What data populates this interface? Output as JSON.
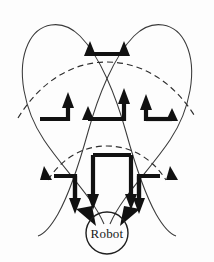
{
  "figure": {
    "robot": {
      "label": "Robot",
      "center_x": 107,
      "center_y": 233,
      "radius": 21
    },
    "colors": {
      "background": "#fdfdfd",
      "petal_stroke": "#3a3a3a",
      "dashed_arc_stroke": "#2e2e2e",
      "flow_stroke": "#111111",
      "robot_stroke": "#1f1f1f",
      "text": "#1a1a1a"
    },
    "petals": [
      {
        "name": "left-petal",
        "apex_x": 47,
        "apex_y": 22
      },
      {
        "name": "right-petal",
        "apex_x": 167,
        "apex_y": 22
      }
    ],
    "dashed_arcs": [
      {
        "name": "outer-dashed-arc",
        "y_apex": 79
      },
      {
        "name": "inner-dashed-arc",
        "y_apex": 152
      }
    ],
    "flow_arrows": [
      {
        "name": "top-double-arrow",
        "direction": "up-both-ends",
        "row": "top"
      },
      {
        "name": "mid-left-arrow",
        "direction": "right-then-up",
        "row": "middle"
      },
      {
        "name": "mid-center-left-arrow",
        "direction": "up-left-end",
        "row": "middle"
      },
      {
        "name": "mid-center-right-arrow",
        "direction": "up",
        "row": "middle"
      },
      {
        "name": "mid-right-up-arrow",
        "direction": "up",
        "row": "middle"
      },
      {
        "name": "mid-right-arrow",
        "direction": "right-end-up",
        "row": "middle"
      },
      {
        "name": "lower-left-bracket-arrow",
        "direction": "down",
        "row": "lower"
      },
      {
        "name": "lower-center-bracket-arrow",
        "direction": "down",
        "row": "lower"
      },
      {
        "name": "lower-right-bracket-arrow",
        "direction": "down",
        "row": "lower"
      },
      {
        "name": "robot-inflow-left-arrow",
        "direction": "down-into-robot",
        "row": "lower"
      },
      {
        "name": "robot-inflow-right-arrow",
        "direction": "down-into-robot",
        "row": "lower"
      }
    ]
  }
}
